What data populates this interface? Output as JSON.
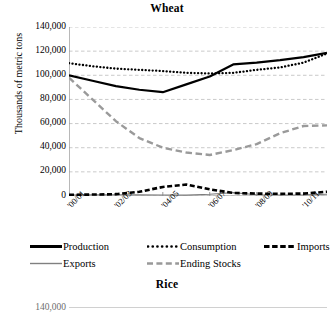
{
  "figure": {
    "panels": [
      {
        "title": "Wheat"
      },
      {
        "title": "Rice"
      }
    ]
  },
  "legend": {
    "items": [
      {
        "label": "Production",
        "style": "solid-thick",
        "color": "#000000"
      },
      {
        "label": "Consumption",
        "style": "dotted",
        "color": "#000000"
      },
      {
        "label": "Imports",
        "style": "dashed-thick",
        "color": "#000000"
      },
      {
        "label": "Exports",
        "style": "solid-thin",
        "color": "#808080"
      },
      {
        "label": "Ending Stocks",
        "style": "dashed-gray",
        "color": "#999999"
      }
    ]
  },
  "chart_data": {
    "type": "line",
    "title": "Wheat",
    "xlabel": "",
    "ylabel": "Thousands of metric tons",
    "ylim": [
      0,
      140000
    ],
    "ytick_labels": [
      "140,000",
      "120,000",
      "100,000",
      "80,000",
      "60,000",
      "40,000",
      "20,000",
      "0"
    ],
    "ytick_values": [
      140000,
      120000,
      100000,
      80000,
      60000,
      40000,
      20000,
      0
    ],
    "grid": true,
    "legend_position": "below-axes",
    "x": [
      "'00/01",
      "'01/02",
      "'02/03",
      "'03/04",
      "'04/05",
      "'05/06",
      "'06/07",
      "'07/08",
      "'08/09",
      "'09/10",
      "'10/11",
      "'11/12"
    ],
    "xtick_labels_shown": [
      "'00/01",
      "'02/03",
      "'04/05",
      "'06/07",
      "'08/09",
      "'10/11"
    ],
    "series": [
      {
        "name": "Production",
        "style": "solid-thick",
        "values": [
          100000,
          95500,
          91000,
          88000,
          86000,
          92500,
          99000,
          109000,
          110500,
          112500,
          115000,
          118500
        ]
      },
      {
        "name": "Consumption",
        "style": "dotted",
        "values": [
          110000,
          107500,
          105500,
          104500,
          103500,
          102000,
          101500,
          102000,
          104500,
          106500,
          110500,
          118000
        ]
      },
      {
        "name": "Imports",
        "style": "dashed-thick",
        "values": [
          1000,
          1200,
          1500,
          3500,
          7500,
          9500,
          5500,
          2500,
          2000,
          1800,
          2000,
          3500
        ]
      },
      {
        "name": "Exports",
        "style": "solid-thin",
        "values": [
          800,
          900,
          1000,
          900,
          800,
          700,
          1500,
          2800,
          1000,
          800,
          900,
          1500
        ]
      },
      {
        "name": "Ending Stocks",
        "style": "dashed-gray",
        "values": [
          98000,
          80000,
          62000,
          48000,
          40000,
          36000,
          34000,
          38000,
          43000,
          52000,
          58000,
          58500
        ]
      }
    ]
  },
  "rice": {
    "partial_ytick": "140,000"
  }
}
